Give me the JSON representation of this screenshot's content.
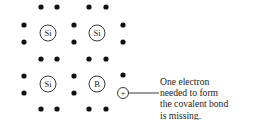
{
  "diagram": {
    "atoms": [
      {
        "label": "Si",
        "cx": 48,
        "cy": 33
      },
      {
        "label": "Si",
        "cx": 97,
        "cy": 33
      },
      {
        "label": "Si",
        "cx": 48,
        "cy": 84
      },
      {
        "label": "B",
        "cx": 97,
        "cy": 84
      }
    ],
    "hole_symbol": "+",
    "annotation_lines": [
      "One electron",
      "needed to form",
      "the covalent bond",
      "is missing."
    ],
    "colors": {
      "ink": "#111111",
      "background": "#ffffff"
    }
  }
}
